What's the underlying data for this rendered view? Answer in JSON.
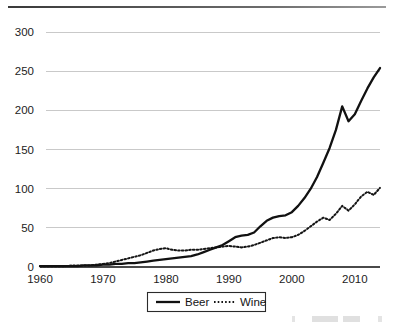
{
  "chart_data": {
    "type": "line",
    "title": "",
    "xlabel": "",
    "ylabel": "",
    "xlim": [
      1960,
      2014
    ],
    "ylim": [
      0,
      300
    ],
    "grid": true,
    "legend_position": "bottom-center",
    "y_ticks": [
      0,
      50,
      100,
      150,
      200,
      250,
      300
    ],
    "x_ticks": [
      1960,
      1970,
      1980,
      1990,
      2000,
      2010
    ],
    "x": [
      1960,
      1961,
      1962,
      1963,
      1964,
      1965,
      1966,
      1967,
      1968,
      1969,
      1970,
      1971,
      1972,
      1973,
      1974,
      1975,
      1976,
      1977,
      1978,
      1979,
      1980,
      1981,
      1982,
      1983,
      1984,
      1985,
      1986,
      1987,
      1988,
      1989,
      1990,
      1991,
      1992,
      1993,
      1994,
      1995,
      1996,
      1997,
      1998,
      1999,
      2000,
      2001,
      2002,
      2003,
      2004,
      2005,
      2006,
      2007,
      2008,
      2009,
      2010,
      2011,
      2012,
      2013,
      2014
    ],
    "series": [
      {
        "name": "Beer",
        "style": "solid",
        "values": [
          1,
          1,
          1,
          1,
          1,
          1,
          1,
          2,
          2,
          2,
          3,
          3,
          4,
          4,
          5,
          5,
          6,
          7,
          8,
          9,
          10,
          11,
          12,
          13,
          14,
          16,
          19,
          22,
          25,
          28,
          33,
          38,
          40,
          41,
          44,
          52,
          59,
          63,
          65,
          66,
          70,
          78,
          88,
          100,
          115,
          133,
          152,
          175,
          205,
          186,
          195,
          212,
          228,
          242,
          254
        ]
      },
      {
        "name": "Wine",
        "style": "dotted",
        "values": [
          1,
          1,
          1,
          1,
          1,
          2,
          2,
          2,
          2,
          3,
          4,
          5,
          7,
          9,
          11,
          13,
          15,
          18,
          21,
          23,
          24,
          22,
          21,
          21,
          22,
          22,
          23,
          24,
          25,
          26,
          27,
          26,
          25,
          26,
          28,
          31,
          34,
          37,
          38,
          37,
          38,
          41,
          46,
          52,
          58,
          63,
          60,
          68,
          78,
          72,
          80,
          90,
          96,
          92,
          101
        ]
      }
    ]
  },
  "legend": {
    "beer_label": "Beer",
    "wine_label": "Wine"
  }
}
